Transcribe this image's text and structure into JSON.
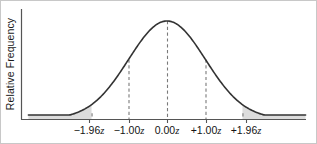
{
  "figure": {
    "background_color": "#ffffff",
    "border_color": "#c8c8c8",
    "width": 317,
    "height": 144
  },
  "axes": {
    "y_axis_label": "Relative Frequency",
    "x_axis_label": "",
    "axis_color": "#555555",
    "baseline_y": 118,
    "y_axis_x": 20,
    "x_axis_left": 20,
    "x_axis_right": 305
  },
  "chart_data": {
    "type": "line",
    "title": "",
    "subtitle": "",
    "xlabel": "",
    "ylabel": "Relative Frequency",
    "curve": "standard normal distribution",
    "grid": false,
    "legend": null,
    "xlim": [
      -3.6,
      3.6
    ],
    "ylim": [
      0,
      1
    ],
    "x_ticks": [
      -1.96,
      -1.0,
      0.0,
      1.0,
      1.96
    ],
    "x_tick_labels": [
      "−1.96z",
      "−1.00z",
      "0.00z",
      "+1.00z",
      "+1.96z"
    ],
    "x_tick_numbers": [
      "−1.96",
      "−1.00",
      "0.00",
      "+1.00",
      "+1.96"
    ],
    "x_tick_suffix": "z",
    "x_tick_pixels": [
      88,
      128,
      166,
      205,
      245
    ],
    "y_ticks": [],
    "y_tick_labels": [],
    "curve_color": "#333333",
    "curve_width": 1.6,
    "dashed_line_color": "#7a7a7a",
    "shaded_region_color": "#dcdcdc",
    "shaded_regions": [
      {
        "name": "left-tail",
        "from": -3.6,
        "to": -1.96
      },
      {
        "name": "right-tail",
        "from": 1.96,
        "to": 3.6
      }
    ],
    "reference_lines": [
      {
        "label": "−1.96z",
        "x": -1.96,
        "height_fraction": 0.058
      },
      {
        "label": "−1.00z",
        "x": -1.0,
        "height_fraction": 0.607
      },
      {
        "label": "0.00z",
        "x": 0.0,
        "height_fraction": 1.0
      },
      {
        "label": "+1.00z",
        "x": 1.0,
        "height_fraction": 0.607
      },
      {
        "label": "+1.96z",
        "x": 1.96,
        "height_fraction": 0.058
      }
    ],
    "series": [
      {
        "name": "normal density",
        "x": [
          -3.6,
          -3.2,
          -2.8,
          -2.4,
          -2.0,
          -1.96,
          -1.6,
          -1.2,
          -1.0,
          -0.8,
          -0.4,
          0.0,
          0.4,
          0.8,
          1.0,
          1.2,
          1.6,
          1.96,
          2.0,
          2.4,
          2.8,
          3.2,
          3.6
        ],
        "values": [
          0.002,
          0.006,
          0.02,
          0.056,
          0.135,
          0.146,
          0.278,
          0.487,
          0.607,
          0.726,
          0.923,
          1.0,
          0.923,
          0.726,
          0.607,
          0.487,
          0.278,
          0.146,
          0.135,
          0.056,
          0.02,
          0.006,
          0.002
        ]
      }
    ]
  }
}
